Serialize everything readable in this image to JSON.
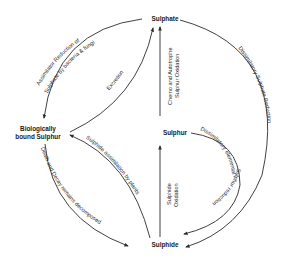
{
  "diagram": {
    "nodes": {
      "sulphate": "Sulphate",
      "bound_line1": "Biologically",
      "bound_line2": "bound Sulphur",
      "sulphur": "Sulphur",
      "sulphide": "Sulphide"
    },
    "processes": {
      "assimilatory_line1": "Assimilator Reduction of",
      "assimilatory_line2": "Sulphate by bacteria & fungi",
      "excretion": "Excretion",
      "chemo_line1": "Chemo and Autotrophe",
      "chemo_line2": "Sulphur Oxidation",
      "dissimilatory_sulphate": "Dissimilatory Sulphate Reduction",
      "dissimilatory_elemental_line1": "Dissimilatory elemental",
      "dissimilatory_elemental_line2": "Sulphur reduction",
      "sulphide_oxidation_line1": "Sulphide",
      "sulphide_oxidation_line2": "Oxidation",
      "sulphide_assimilation": "Sulphide assimilation by plants",
      "death_decay": "Death and Decay remains decomposed"
    },
    "colors": {
      "line": "#2b2b2b",
      "text": "#1a1a1a",
      "background": "#ffffff"
    }
  }
}
